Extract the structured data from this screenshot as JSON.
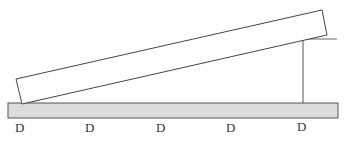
{
  "diagram": {
    "board": {
      "fill": "#dcdcdc",
      "stroke": "#555555"
    },
    "plank": {
      "stroke": "#444444",
      "fill": "#ffffff"
    },
    "support": {
      "stroke": "#555555"
    },
    "labels": [
      {
        "text": "D",
        "x": 20
      },
      {
        "text": "D",
        "x": 90
      },
      {
        "text": "D",
        "x": 161
      },
      {
        "text": "D",
        "x": 231
      },
      {
        "text": "D",
        "x": 302
      }
    ]
  }
}
